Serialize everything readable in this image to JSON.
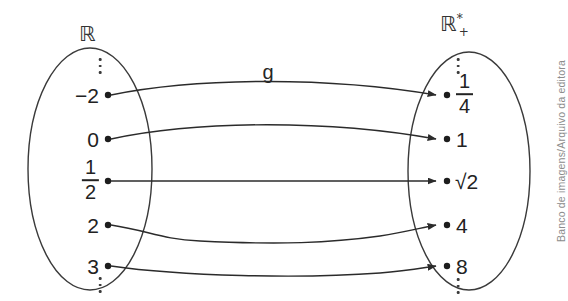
{
  "figure": {
    "type": "mapping-diagram",
    "function_label": "g",
    "credit": "Banco de imagens/Arquivo da editora",
    "colors": {
      "background": "#ffffff",
      "stroke": "#333333",
      "text": "#222222",
      "credit_text": "#8c8c8c"
    }
  },
  "domain_set": {
    "label_base": "ℝ",
    "label_sup": "",
    "label_sub": "",
    "top_ellipsis": "⋮",
    "bottom_ellipsis": "⋮",
    "elements": [
      {
        "display": "−2",
        "kind": "plain"
      },
      {
        "display": "0",
        "kind": "plain"
      },
      {
        "numerator": "1",
        "denominator": "2",
        "kind": "fraction"
      },
      {
        "display": "2",
        "kind": "plain"
      },
      {
        "display": "3",
        "kind": "plain"
      }
    ]
  },
  "codomain_set": {
    "label_base": "ℝ",
    "label_sup": "*",
    "label_sub": "+",
    "top_ellipsis": "⋮",
    "bottom_ellipsis": "⋮",
    "elements": [
      {
        "numerator": "1",
        "denominator": "4",
        "kind": "fraction"
      },
      {
        "display": "1",
        "kind": "plain"
      },
      {
        "display": "√2",
        "kind": "plain"
      },
      {
        "display": "4",
        "kind": "plain"
      },
      {
        "display": "8",
        "kind": "plain"
      }
    ]
  },
  "mappings": [
    {
      "from": "−2",
      "to": "1/4"
    },
    {
      "from": "0",
      "to": "1"
    },
    {
      "from": "1/2",
      "to": "√2"
    },
    {
      "from": "2",
      "to": "4"
    },
    {
      "from": "3",
      "to": "8"
    }
  ]
}
